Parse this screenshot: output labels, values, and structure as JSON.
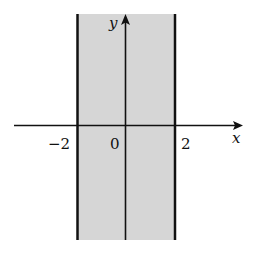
{
  "figure": {
    "region_fill": "#d6d6d6",
    "line_color": "#111111",
    "axes": {
      "x_label": "x",
      "y_label": "y"
    },
    "ticks": {
      "left": "−2",
      "origin": "0",
      "right": "2"
    },
    "boundaries": [
      {
        "name": "x = -2",
        "value": -2
      },
      {
        "name": "x = 2",
        "value": 2
      }
    ]
  }
}
